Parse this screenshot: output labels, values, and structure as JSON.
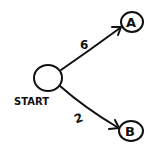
{
  "diagram": {
    "type": "weighted-directed-graph",
    "nodes": [
      {
        "id": "start",
        "label": "START"
      },
      {
        "id": "a",
        "label": "A"
      },
      {
        "id": "b",
        "label": "B"
      }
    ],
    "edges": [
      {
        "from": "START",
        "to": "A",
        "weight": "6"
      },
      {
        "from": "START",
        "to": "B",
        "weight": "2"
      }
    ]
  },
  "colors": {
    "ink": "#111111",
    "background": "#ffffff"
  }
}
